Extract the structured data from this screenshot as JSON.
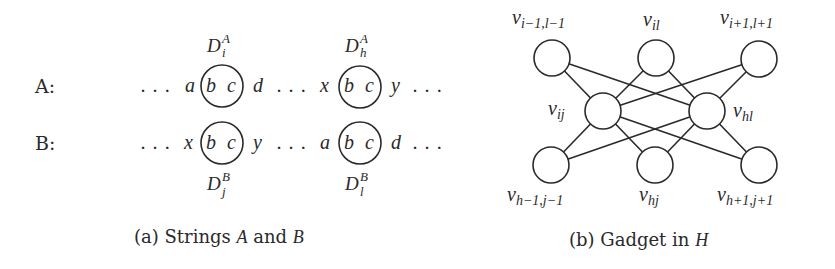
{
  "panel_a": {
    "caption_prefix": "(a) Strings ",
    "caption_var1": "A",
    "caption_mid": " and ",
    "caption_var2": "B",
    "rows": [
      {
        "label": "A:",
        "tokens": [
          "...",
          "a",
          "b c",
          "d",
          "...",
          "x",
          "b c",
          "y",
          "..."
        ],
        "blocks": [
          {
            "letter": "D",
            "sub": "i",
            "sup": "A",
            "content": "b c"
          },
          {
            "letter": "D",
            "sub": "h",
            "sup": "A",
            "content": "b c"
          }
        ]
      },
      {
        "label": "B:",
        "tokens": [
          "...",
          "x",
          "b c",
          "y",
          "...",
          "a",
          "b c",
          "d",
          "..."
        ],
        "blocks": [
          {
            "letter": "D",
            "sub": "j",
            "sup": "B",
            "content": "b c"
          },
          {
            "letter": "D",
            "sub": "l",
            "sup": "B",
            "content": "b c"
          }
        ]
      }
    ],
    "dots": ". . .",
    "circle_text_b": "b",
    "circle_text_c": "c",
    "row_a_left": "a",
    "row_a_right": "d",
    "row_a_left2": "x",
    "row_a_right2": "y",
    "row_b_left": "x",
    "row_b_right": "y",
    "row_b_left2": "a",
    "row_b_right2": "d",
    "D": "D",
    "sup_A": "A",
    "sup_B": "B",
    "sub_i": "i",
    "sub_h": "h",
    "sub_j": "j",
    "sub_l": "l",
    "label_A": "A:",
    "label_B": "B:"
  },
  "panel_b": {
    "caption_prefix": "(b) Gadget in ",
    "caption_var": "H",
    "v": "v",
    "nodes": [
      {
        "id": "v_i-1,l-1",
        "sub": "i−1,l−1",
        "position": "top-left"
      },
      {
        "id": "v_il",
        "sub": "il",
        "position": "top-middle"
      },
      {
        "id": "v_i+1,l+1",
        "sub": "i+1,l+1",
        "position": "top-right"
      },
      {
        "id": "v_ij",
        "sub": "ij",
        "position": "middle-left"
      },
      {
        "id": "v_hl",
        "sub": "hl",
        "position": "middle-right"
      },
      {
        "id": "v_h-1,j-1",
        "sub": "h−1,j−1",
        "position": "bottom-left"
      },
      {
        "id": "v_hj",
        "sub": "hj",
        "position": "bottom-middle"
      },
      {
        "id": "v_h+1,j+1",
        "sub": "h+1,j+1",
        "position": "bottom-right"
      }
    ],
    "edges": [
      [
        "v_ij",
        "v_i-1,l-1"
      ],
      [
        "v_ij",
        "v_il"
      ],
      [
        "v_ij",
        "v_i+1,l+1"
      ],
      [
        "v_ij",
        "v_h-1,j-1"
      ],
      [
        "v_ij",
        "v_hj"
      ],
      [
        "v_ij",
        "v_h+1,j+1"
      ],
      [
        "v_hl",
        "v_i-1,l-1"
      ],
      [
        "v_hl",
        "v_il"
      ],
      [
        "v_hl",
        "v_i+1,l+1"
      ],
      [
        "v_hl",
        "v_h-1,j-1"
      ],
      [
        "v_hl",
        "v_hj"
      ],
      [
        "v_hl",
        "v_h+1,j+1"
      ]
    ]
  },
  "colors": {
    "ink": "#2a2a2a",
    "background": "#ffffff"
  }
}
